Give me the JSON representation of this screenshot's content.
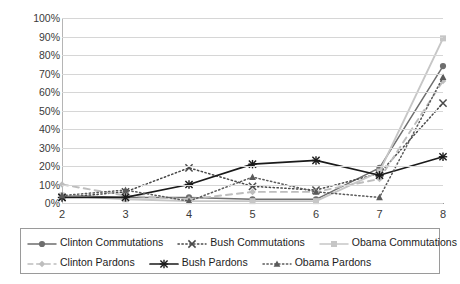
{
  "chart_data": {
    "type": "line",
    "title": "",
    "xlabel": "",
    "ylabel": "",
    "x": [
      2,
      3,
      4,
      5,
      6,
      7,
      8
    ],
    "categories": [
      "2",
      "3",
      "4",
      "5",
      "6",
      "7",
      "8"
    ],
    "xtick_labels": [
      "2",
      "3",
      "4",
      "5",
      "6",
      "7",
      "8"
    ],
    "ytick_labels": [
      "100%",
      "90%",
      "80%",
      "70%",
      "60%",
      "50%",
      "40%",
      "30%",
      "20%",
      "10%",
      "0%"
    ],
    "ytick_values": [
      100,
      90,
      80,
      70,
      60,
      50,
      40,
      30,
      20,
      10,
      0
    ],
    "ylim": [
      0,
      100
    ],
    "xlim": [
      2,
      8
    ],
    "grid": "horizontal",
    "legend_position": "bottom",
    "series": [
      {
        "name": "Clinton Commutations",
        "values": [
          4,
          3,
          3,
          2,
          2,
          19,
          74
        ],
        "color": "#6e6e6e",
        "line": "solid",
        "marker": "circle"
      },
      {
        "name": "Bush Commutations",
        "values": [
          3,
          6,
          19,
          9,
          7,
          16,
          54
        ],
        "color": "#4a4a4a",
        "line": "dotted",
        "marker": "x"
      },
      {
        "name": "Obama Commutations",
        "values": [
          4,
          2,
          1,
          1,
          1,
          17,
          89
        ],
        "color": "#c6c6c6",
        "line": "solid",
        "marker": "square"
      },
      {
        "name": "Clinton Pardons",
        "values": [
          10,
          4,
          2,
          6,
          6,
          13,
          66
        ],
        "color": "#bdbdbd",
        "line": "dashed",
        "marker": "diamond"
      },
      {
        "name": "Bush Pardons",
        "values": [
          3,
          3,
          10,
          21,
          23,
          15,
          25
        ],
        "color": "#1a1a1a",
        "line": "solid",
        "marker": "asterisk"
      },
      {
        "name": "Obama Pardons",
        "values": [
          4,
          7,
          1,
          14,
          6,
          3,
          68
        ],
        "color": "#5a5a5a",
        "line": "dotted",
        "marker": "triangle"
      }
    ]
  },
  "legend": {
    "rows": [
      [
        "Clinton Commutations",
        "Bush Commutations",
        "Obama Commutations"
      ],
      [
        "Clinton Pardons",
        "Bush Pardons",
        "Obama Pardons"
      ]
    ]
  }
}
